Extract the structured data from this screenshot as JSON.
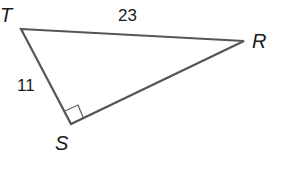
{
  "diagram": {
    "type": "right-triangle",
    "vertices": [
      {
        "label": "T",
        "x": 21,
        "y": 29
      },
      {
        "label": "R",
        "x": 244,
        "y": 41
      },
      {
        "label": "S",
        "x": 71,
        "y": 124
      }
    ],
    "sides": [
      {
        "from": "T",
        "to": "R",
        "length_label": "23"
      },
      {
        "from": "T",
        "to": "S",
        "length_label": "11"
      },
      {
        "from": "S",
        "to": "R",
        "length_label": ""
      }
    ],
    "right_angle_at": "S",
    "labels": {
      "T": "T",
      "R": "R",
      "S": "S",
      "TR": "23",
      "TS": "11"
    },
    "colors": {
      "stroke": "#555555",
      "text": "#1a1a1a",
      "background": "#ffffff"
    }
  }
}
